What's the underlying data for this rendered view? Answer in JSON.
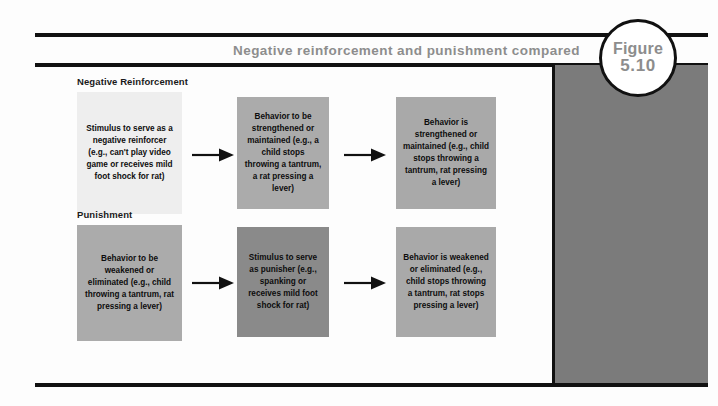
{
  "figure": {
    "title": "Negative reinforcement and punishment compared",
    "badge_label": "Figure",
    "badge_number": "5.10"
  },
  "colors": {
    "rule": "#111111",
    "title_text": "#8d8d8d",
    "side_panel": "#7b7b7b",
    "box_light": "#eeeeee",
    "box_medium": "#ababab",
    "box_dark": "#8a8a8a"
  },
  "rows": [
    {
      "label": "Negative Reinforcement",
      "boxes": [
        {
          "text": "Stimulus to serve as a negative reinforcer (e.g., can't play video game or receives mild foot shock for rat)",
          "shade": "light"
        },
        {
          "text": "Behavior to be strengthened or maintained (e.g., a child stops throwing a tantrum, a rat pressing a lever)",
          "shade": "medium"
        },
        {
          "text": "Behavior is strengthened or maintained (e.g., child stops throwing a tantrum, rat pressing a lever)",
          "shade": "medium"
        }
      ],
      "arrows": [
        "arrow-right",
        "arrow-right"
      ]
    },
    {
      "label": "Punishment",
      "boxes": [
        {
          "text": "Behavior to be weakened or eliminated (e.g., child throwing a tantrum, rat pressing a lever)",
          "shade": "medium"
        },
        {
          "text": "Stimulus to serve as punisher (e.g., spanking or receives mild foot shock for rat)",
          "shade": "dark"
        },
        {
          "text": "Behavior is weakened or eliminated (e.g., child stops throwing a tantrum, rat stops pressing a lever)",
          "shade": "medium"
        }
      ],
      "arrows": [
        "arrow-right",
        "arrow-right"
      ]
    }
  ]
}
